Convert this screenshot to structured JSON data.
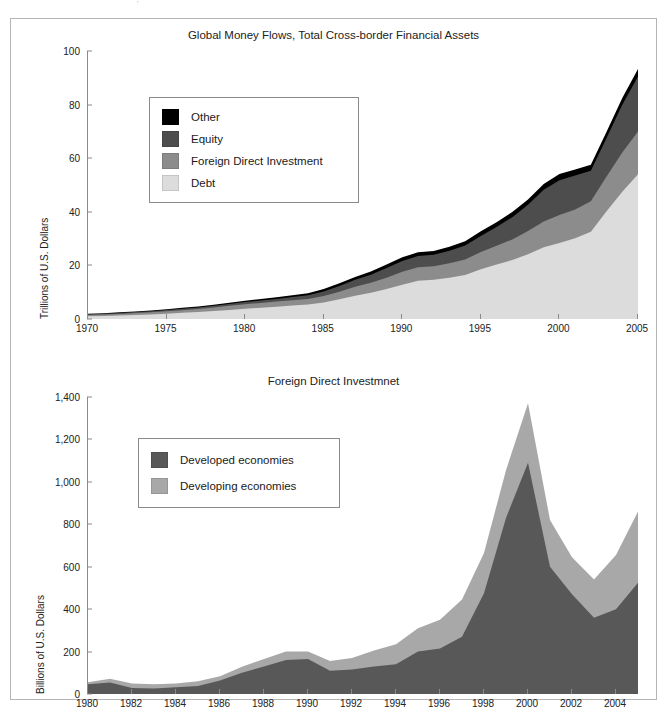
{
  "page": {
    "header_fragment": "· ···· ··· ·· ·· ··· ··· ,"
  },
  "charts": [
    {
      "title": "Global Money Flows, Total Cross-border Financial Assets",
      "ylabel": "Trillions of U.S. Dollars",
      "legend": [
        {
          "label": "Other",
          "color": "#000000"
        },
        {
          "label": "Equity",
          "color": "#4d4d4d"
        },
        {
          "label": "Foreign Direct Investment",
          "color": "#8c8c8c"
        },
        {
          "label": "Debt",
          "color": "#dcdcdc"
        }
      ]
    },
    {
      "title": "Foreign Direct Investmnet",
      "ylabel": "Billions of U.S. Dollars",
      "legend": [
        {
          "label": "Developed economies",
          "color": "#585858"
        },
        {
          "label": "Developing economies",
          "color": "#a8a8a8"
        }
      ]
    }
  ],
  "chart_data": [
    {
      "type": "area",
      "stacked": true,
      "title": "Global Money Flows, Total Cross-border Financial Assets",
      "xlabel": "",
      "ylabel": "Trillions of U.S. Dollars",
      "xlim": [
        1970,
        2005
      ],
      "ylim": [
        0,
        100
      ],
      "yticks": [
        0,
        20,
        40,
        60,
        80,
        100
      ],
      "ytick_labels": [
        "0",
        "20",
        "40",
        "60",
        "80",
        "100"
      ],
      "xticks": [
        1970,
        1975,
        1980,
        1985,
        1990,
        1995,
        2000,
        2005
      ],
      "xtick_labels": [
        "1970",
        "1975",
        "1980",
        "1985",
        "1990",
        "1995",
        "2000",
        "2005"
      ],
      "grid": false,
      "legend_position": "upper-left",
      "x": [
        1970,
        1971,
        1972,
        1973,
        1974,
        1975,
        1976,
        1977,
        1978,
        1979,
        1980,
        1981,
        1982,
        1983,
        1984,
        1985,
        1986,
        1987,
        1988,
        1989,
        1990,
        1991,
        1992,
        1993,
        1994,
        1995,
        1996,
        1997,
        1998,
        1999,
        2000,
        2001,
        2002,
        2003,
        2004,
        2005
      ],
      "series": [
        {
          "name": "Debt",
          "color": "#dcdcdc",
          "values": [
            1.0,
            1.1,
            1.3,
            1.5,
            1.7,
            2.0,
            2.3,
            2.6,
            3.0,
            3.4,
            3.8,
            4.2,
            4.6,
            5.0,
            5.4,
            6.2,
            7.4,
            8.7,
            9.8,
            11.2,
            12.8,
            14.3,
            14.6,
            15.4,
            16.4,
            18.6,
            20.3,
            22.0,
            24.2,
            26.8,
            28.4,
            30.1,
            32.6,
            40.2,
            47.5,
            54.0
          ]
        },
        {
          "name": "Foreign Direct Investment",
          "color": "#8c8c8c",
          "values": [
            0.5,
            0.55,
            0.6,
            0.7,
            0.8,
            0.9,
            1.0,
            1.1,
            1.3,
            1.5,
            1.7,
            1.8,
            1.9,
            2.0,
            2.1,
            2.4,
            2.8,
            3.3,
            3.7,
            4.2,
            4.8,
            5.0,
            5.1,
            5.4,
            5.8,
            6.4,
            7.0,
            7.7,
            8.6,
            9.6,
            10.4,
            10.8,
            11.3,
            13.0,
            14.6,
            16.0
          ]
        },
        {
          "name": "Equity",
          "color": "#4d4d4d",
          "values": [
            0.3,
            0.32,
            0.35,
            0.38,
            0.4,
            0.45,
            0.5,
            0.55,
            0.6,
            0.7,
            0.8,
            0.9,
            1.0,
            1.2,
            1.4,
            1.7,
            2.1,
            2.6,
            3.0,
            3.6,
            4.0,
            4.2,
            4.3,
            4.7,
            5.2,
            6.0,
            7.0,
            8.3,
            9.8,
            11.8,
            13.0,
            12.6,
            11.4,
            14.3,
            17.8,
            20.5
          ]
        },
        {
          "name": "Other",
          "color": "#000000",
          "values": [
            0.2,
            0.22,
            0.24,
            0.26,
            0.3,
            0.33,
            0.36,
            0.4,
            0.44,
            0.5,
            0.55,
            0.6,
            0.65,
            0.7,
            0.75,
            0.9,
            1.0,
            1.1,
            1.2,
            1.3,
            1.4,
            1.4,
            1.4,
            1.5,
            1.6,
            1.7,
            1.8,
            1.9,
            2.0,
            2.2,
            2.3,
            2.3,
            2.3,
            2.4,
            2.6,
            2.8
          ]
        }
      ],
      "totals": [
        2.0,
        2.2,
        2.5,
        2.8,
        3.2,
        3.7,
        4.2,
        4.7,
        5.3,
        6.1,
        6.9,
        7.5,
        8.2,
        8.9,
        9.7,
        11.2,
        13.3,
        15.7,
        17.7,
        20.3,
        23.0,
        24.9,
        25.4,
        27.0,
        29.0,
        32.7,
        36.1,
        39.9,
        44.6,
        50.4,
        54.1,
        55.8,
        57.6,
        69.9,
        82.5,
        93.3
      ]
    },
    {
      "type": "area",
      "stacked": true,
      "title": "Foreign Direct Investmnet",
      "xlabel": "",
      "ylabel": "Billions of U.S. Dollars",
      "xlim": [
        1980,
        2005
      ],
      "ylim": [
        0,
        1400
      ],
      "yticks": [
        0,
        200,
        400,
        600,
        800,
        1000,
        1200,
        1400
      ],
      "ytick_labels": [
        "0",
        "200",
        "400",
        "600",
        "800",
        "1,000",
        "1,200",
        "1,400"
      ],
      "xticks": [
        1980,
        1982,
        1984,
        1986,
        1988,
        1990,
        1992,
        1994,
        1996,
        1998,
        2000,
        2002,
        2004
      ],
      "xtick_labels": [
        "1980",
        "1982",
        "1984",
        "1986",
        "1988",
        "1990",
        "1992",
        "1994",
        "1996",
        "1998",
        "2000",
        "2002",
        "2004"
      ],
      "grid": false,
      "legend_position": "upper-left",
      "x": [
        1980,
        1981,
        1982,
        1983,
        1984,
        1985,
        1986,
        1987,
        1988,
        1989,
        1990,
        1991,
        1992,
        1993,
        1994,
        1995,
        1996,
        1997,
        1998,
        1999,
        2000,
        2001,
        2002,
        2003,
        2004,
        2005
      ],
      "series": [
        {
          "name": "Developed economies",
          "color": "#585858",
          "values": [
            46,
            54,
            28,
            26,
            32,
            38,
            64,
            100,
            130,
            160,
            165,
            110,
            115,
            130,
            140,
            200,
            215,
            270,
            475,
            830,
            1090,
            600,
            470,
            360,
            400,
            525
          ]
        },
        {
          "name": "Developing economies",
          "color": "#a8a8a8",
          "values": [
            9,
            18,
            22,
            20,
            18,
            22,
            20,
            28,
            35,
            40,
            35,
            45,
            55,
            75,
            95,
            110,
            135,
            175,
            190,
            225,
            280,
            220,
            175,
            180,
            255,
            335
          ]
        }
      ],
      "totals": [
        55,
        72,
        50,
        46,
        50,
        60,
        84,
        128,
        165,
        200,
        200,
        155,
        170,
        205,
        235,
        310,
        350,
        445,
        665,
        1055,
        1370,
        820,
        645,
        540,
        655,
        860
      ]
    }
  ]
}
